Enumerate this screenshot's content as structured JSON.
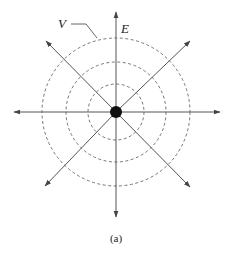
{
  "diagram": {
    "labels": {
      "potential": "V",
      "field": "E",
      "caption": "(a)"
    },
    "center": [
      116,
      112
    ],
    "equipotential_radii": [
      28,
      50,
      74
    ],
    "field_line_tips": [
      [
        116,
        12
      ],
      [
        116,
        217
      ],
      [
        14,
        112
      ],
      [
        220,
        112
      ],
      [
        46,
        41
      ],
      [
        190,
        41
      ],
      [
        45,
        186
      ],
      [
        190,
        187
      ]
    ],
    "colors": {
      "line": "#555555",
      "charge": "#111111",
      "dashed": "#666666"
    }
  }
}
